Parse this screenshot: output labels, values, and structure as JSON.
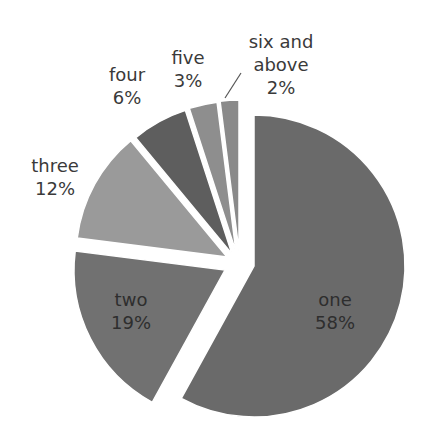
{
  "chart_data": {
    "type": "pie",
    "title": "",
    "exploded": true,
    "start_angle_deg": 0,
    "direction": "clockwise",
    "categories": [
      "one",
      "two",
      "three",
      "four",
      "five",
      "six and above"
    ],
    "values": [
      58,
      19,
      12,
      6,
      3,
      2
    ],
    "labels": [
      {
        "name": "one",
        "pct": "58%"
      },
      {
        "name": "two",
        "pct": "19%"
      },
      {
        "name": "three",
        "pct": "12%"
      },
      {
        "name": "four",
        "pct": "6%"
      },
      {
        "name": "five",
        "pct": "3%"
      },
      {
        "name": "six and above",
        "pct": "2%"
      }
    ],
    "colors": [
      "#6a6a6a",
      "#717171",
      "#9a9a9a",
      "#5e5e5e",
      "#8e8e8e",
      "#8a8a8a"
    ],
    "legend": "none",
    "data_labels": "category name and percentage"
  },
  "geometry": {
    "radius": 151,
    "slices": [
      {
        "cx": 254,
        "cy": 266
      },
      {
        "cx": 225,
        "cy": 270
      },
      {
        "cx": 227,
        "cy": 257
      },
      {
        "cx": 232,
        "cy": 254
      },
      {
        "cx": 236,
        "cy": 252
      },
      {
        "cx": 239,
        "cy": 251
      }
    ]
  },
  "label_positions": [
    {
      "x": 335,
      "y": 288,
      "inside": true,
      "lines": [
        "one",
        "58%"
      ]
    },
    {
      "x": 131,
      "y": 288,
      "inside": true,
      "lines": [
        "two",
        "19%"
      ]
    },
    {
      "x": 55,
      "y": 154,
      "inside": false,
      "lines": [
        "three",
        "12%"
      ]
    },
    {
      "x": 127,
      "y": 63,
      "inside": false,
      "lines": [
        "four",
        "6%"
      ]
    },
    {
      "x": 188,
      "y": 46,
      "inside": false,
      "lines": [
        "five",
        "3%"
      ]
    },
    {
      "x": 281,
      "y": 30,
      "inside": false,
      "lines": [
        "six and",
        "above",
        "2%"
      ]
    }
  ],
  "leader_line": {
    "x1": 225,
    "y1": 98,
    "x2": 241,
    "y2": 73,
    "color": "#555555"
  }
}
